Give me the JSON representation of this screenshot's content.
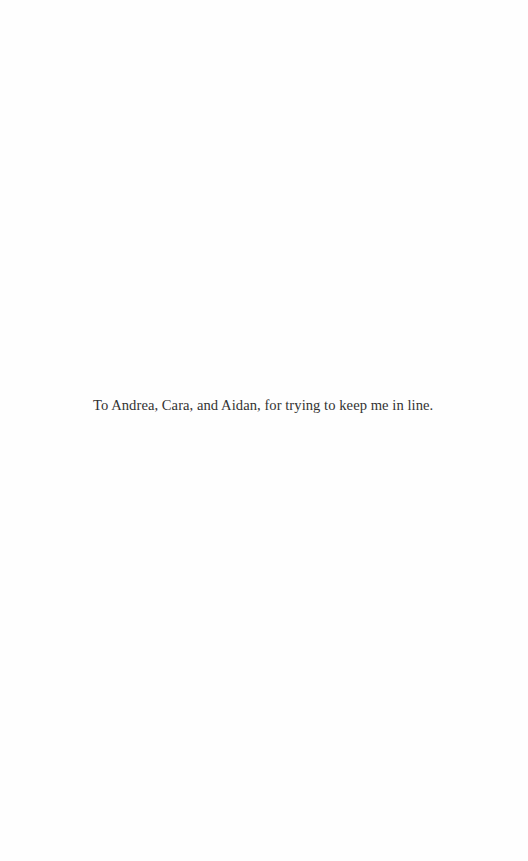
{
  "page": {
    "dedication": "To Andrea, Cara, and Aidan, for trying to keep me in line."
  }
}
